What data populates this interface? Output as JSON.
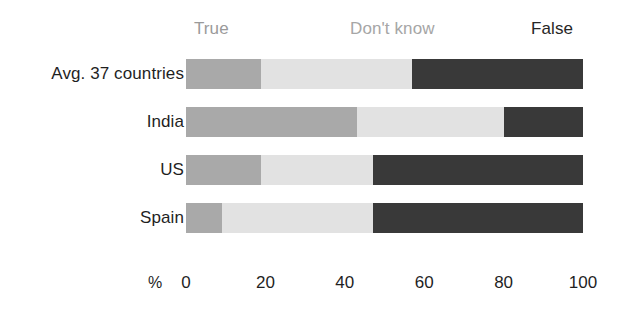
{
  "chart_data": {
    "type": "bar",
    "subtype": "stacked-horizontal-100",
    "title": "",
    "xlabel": "%",
    "ylabel": "",
    "xlim": [
      0,
      100
    ],
    "grid": false,
    "legend_position": "top",
    "categories": [
      "Avg. 37 countries",
      "India",
      "US",
      "Spain"
    ],
    "series": [
      {
        "name": "True",
        "color": "#a9a9a9",
        "values": [
          19,
          43,
          19,
          9
        ]
      },
      {
        "name": "Don't know",
        "color": "#e2e2e2",
        "values": [
          38,
          37,
          28,
          38
        ]
      },
      {
        "name": "False",
        "color": "#393939",
        "values": [
          43,
          20,
          53,
          53
        ]
      }
    ],
    "xticks": [
      "0",
      "20",
      "40",
      "60",
      "80",
      "100"
    ],
    "xtick_values": [
      0,
      20,
      40,
      60,
      80,
      100
    ]
  },
  "legend": {
    "true_label": "True",
    "dont_know_label": "Don't know",
    "false_label": "False"
  },
  "axis": {
    "unit": "%",
    "ticks": [
      "0",
      "20",
      "40",
      "60",
      "80",
      "100"
    ]
  },
  "rows": [
    {
      "label": "Avg. 37 countries",
      "segments": [
        {
          "name": "True",
          "value": 19
        },
        {
          "name": "Don't know",
          "value": 38
        },
        {
          "name": "False",
          "value": 43
        }
      ]
    },
    {
      "label": "India",
      "segments": [
        {
          "name": "True",
          "value": 43
        },
        {
          "name": "Don't know",
          "value": 37
        },
        {
          "name": "False",
          "value": 20
        }
      ]
    },
    {
      "label": "US",
      "segments": [
        {
          "name": "True",
          "value": 19
        },
        {
          "name": "Don't know",
          "value": 28
        },
        {
          "name": "False",
          "value": 53
        }
      ]
    },
    {
      "label": "Spain",
      "segments": [
        {
          "name": "True",
          "value": 9
        },
        {
          "name": "Don't know",
          "value": 38
        },
        {
          "name": "False",
          "value": 53
        }
      ]
    }
  ],
  "colors": {
    "true": "#a9a9a9",
    "dont_know": "#e2e2e2",
    "false": "#393939",
    "text_dark": "#1f1f1f",
    "text_muted": "#9a9a9a"
  }
}
